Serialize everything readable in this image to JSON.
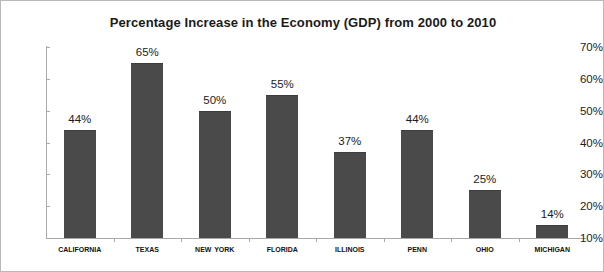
{
  "chart_data": {
    "type": "bar",
    "title": "Percentage Increase in the Economy (GDP) from 2000 to 2010",
    "xlabel": "",
    "ylabel": "",
    "categories": [
      "California",
      "Texas",
      "New York",
      "Florida",
      "Illinois",
      "Penn",
      "Ohio",
      "Michigan"
    ],
    "values": [
      44,
      65,
      50,
      55,
      37,
      44,
      25,
      14
    ],
    "value_labels": [
      "44%",
      "65%",
      "50%",
      "55%",
      "37%",
      "44%",
      "25%",
      "14%"
    ],
    "ylim": [
      10,
      70
    ],
    "y_ticks": [
      10,
      20,
      30,
      40,
      50,
      60,
      70
    ],
    "y_tick_labels": [
      "10%",
      "20%",
      "30%",
      "40%",
      "50%",
      "60%",
      "70%"
    ],
    "grid": false,
    "legend": false,
    "bar_color": "#4a4a4a",
    "axis_color": "#a8a8a8",
    "frame_color": "#b9b9b9",
    "text_color": "#1a1a1a"
  }
}
